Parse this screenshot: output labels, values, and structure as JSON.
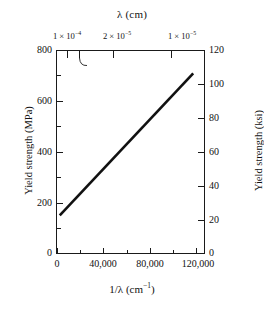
{
  "chart_data": {
    "type": "line",
    "title": "",
    "xlabel": "1/λ (cm⁻¹)",
    "ylabel": "Yield strength (MPa)",
    "y2label": "Yield strength (ksi)",
    "x2label": "λ (cm)",
    "xlim": [
      0,
      130000
    ],
    "ylim": [
      0,
      800
    ],
    "y2lim": [
      0,
      120
    ],
    "grid": false,
    "legend": "none",
    "x_ticks": [
      0,
      40000,
      80000,
      120000
    ],
    "x_tick_labels": [
      "0",
      "40,000",
      "80,000",
      "120,000"
    ],
    "x_minor_ticks": [
      20000,
      60000,
      100000
    ],
    "y_ticks": [
      0,
      200,
      400,
      600,
      800
    ],
    "y_tick_labels": [
      "0",
      "200",
      "400",
      "600",
      "800"
    ],
    "y_minor_ticks": [
      100,
      300,
      500,
      700
    ],
    "y2_ticks": [
      0,
      20,
      40,
      60,
      80,
      100,
      120
    ],
    "y2_tick_labels": [
      "0",
      "20",
      "40",
      "60",
      "80",
      "100",
      "120"
    ],
    "x2_ticks_in_x_units": [
      10000,
      20000,
      50000,
      100000
    ],
    "x2_tick_labels": [
      "1 × 10⁻⁴",
      "5 × 10⁻⁵",
      "2 × 10⁻⁵",
      "1 × 10⁻⁵"
    ],
    "annotation": "5 × 10⁻⁵",
    "series": [
      {
        "name": "Yield strength",
        "x": [
          2000,
          120000
        ],
        "values": [
          150,
          710
        ],
        "color": "#111111"
      }
    ]
  },
  "axes": {
    "top": {
      "title": "λ (cm)",
      "ticks": [
        {
          "label_html": "1 × 10<sup>−4</sup>",
          "x_frac": 0.0769
        },
        {
          "label_html": "",
          "x_frac": 0.1538
        },
        {
          "label_html": "2 × 10<sup>−5</sup>",
          "x_frac": 0.3846
        },
        {
          "label_html": "1 × 10<sup>−5</sup>",
          "x_frac": 0.7692
        }
      ],
      "annotation_html": "5 × 10<sup>−5</sup>"
    },
    "left": {
      "title": "Yield strength (MPa)",
      "labels": [
        "800",
        "600",
        "400",
        "200",
        "0"
      ]
    },
    "right": {
      "title": "Yield strength (ksi)",
      "labels": [
        "120",
        "100",
        "80",
        "60",
        "40",
        "20",
        "0"
      ]
    },
    "bottom": {
      "title_html": "1/λ (cm<sup>−1</sup>)",
      "labels": [
        "0",
        "40,000",
        "80,000",
        "120,000"
      ]
    }
  },
  "colors": {
    "line": "#111111",
    "axis": "#1a1a1a",
    "background": "#ffffff"
  }
}
